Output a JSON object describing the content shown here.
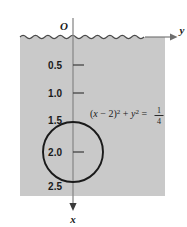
{
  "figure": {
    "type": "math-diagram",
    "colors": {
      "background": "#ffffff",
      "water_fill": "#c9c9c9",
      "axis": "#6e6e6e",
      "curve": "#1a1a1a",
      "text": "#1a1a1a"
    },
    "origin_label": "O",
    "axes": {
      "vertical": {
        "name": "x",
        "direction": "down",
        "tick_values": [
          "0.5",
          "1.0",
          "1.5",
          "2.0",
          "2.5"
        ]
      },
      "horizontal": {
        "name": "y",
        "direction": "right"
      }
    },
    "water_surface": {
      "style": "wavy-line",
      "label": ""
    },
    "equation": {
      "lhs_open": "(",
      "var_x": "x",
      "minus_two": " − 2",
      "lhs_close": ")",
      "exp_one": "2",
      "plus": " + ",
      "var_y": "y",
      "exp_two": "2",
      "equals": " = ",
      "fraction_numerator": "1",
      "fraction_denominator": "4",
      "plain_text": "(x − 2)² + y² = 1/4"
    },
    "circle": {
      "center_x_value": "2",
      "center_y_value": "0",
      "radius_value": "1/2"
    }
  }
}
